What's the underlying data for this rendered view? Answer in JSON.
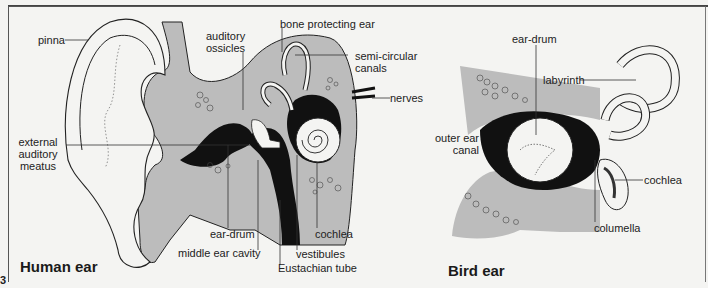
{
  "figure_number": "3",
  "human_ear": {
    "title": "Human ear",
    "labels": {
      "pinna": "pinna",
      "auditory_ossicles": "auditory\nossicles",
      "bone_protecting_ear": "bone protecting ear",
      "semi_circular_canals": "semi-circular\ncanals",
      "nerves": "nerves",
      "external_auditory_meatus": "external\nauditory\nmeatus",
      "ear_drum": "ear-drum",
      "middle_ear_cavity": "middle ear cavity",
      "cochlea": "cochlea",
      "vestibules": "vestibules",
      "eustachian_tube": "Eustachian tube"
    }
  },
  "bird_ear": {
    "title": "Bird ear",
    "labels": {
      "ear_drum": "ear-drum",
      "labyrinth": "labyrinth",
      "outer_ear_canal": "outer ear\ncanal",
      "cochlea": "cochlea",
      "columella": "columella"
    }
  },
  "colors": {
    "bone_gray": "#b9b9b9",
    "ink": "#111111",
    "paper": "#f4f4f2"
  }
}
